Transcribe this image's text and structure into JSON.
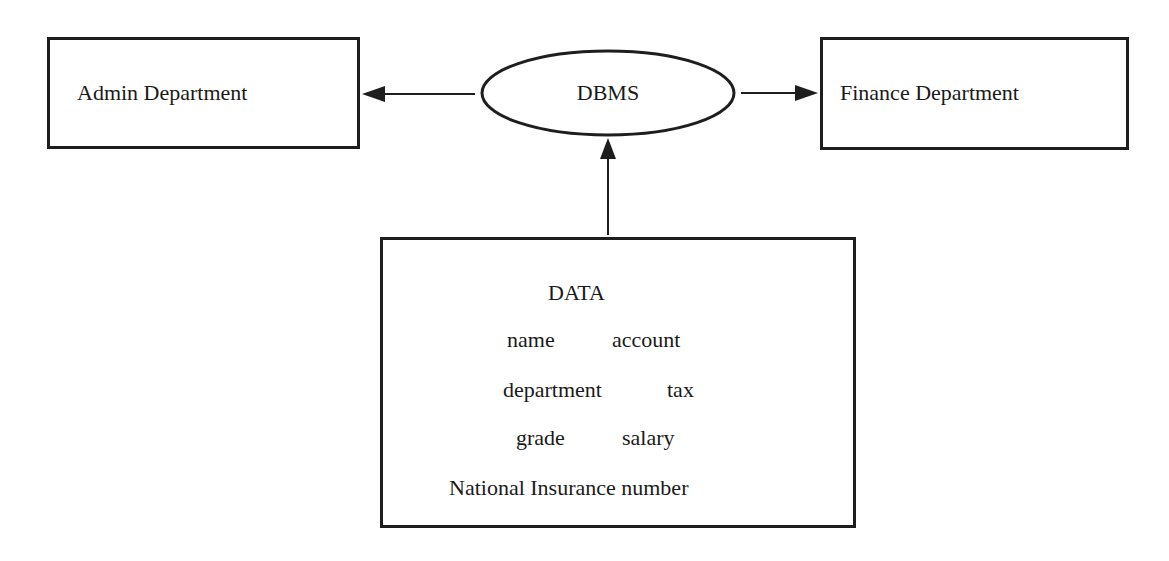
{
  "diagram": {
    "type": "data-flow",
    "nodes": {
      "admin": {
        "label": "Admin Department",
        "shape": "rectangle"
      },
      "dbms": {
        "label": "DBMS",
        "shape": "ellipse"
      },
      "finance": {
        "label": "Finance Department",
        "shape": "rectangle"
      },
      "data": {
        "title": "DATA",
        "shape": "rectangle",
        "fields": {
          "name": "name",
          "account": "account",
          "department": "department",
          "tax": "tax",
          "grade": "grade",
          "salary": "salary",
          "national_insurance": "National Insurance number"
        }
      }
    },
    "edges": [
      {
        "from": "dbms",
        "to": "admin",
        "direction": "left"
      },
      {
        "from": "dbms",
        "to": "finance",
        "direction": "right"
      },
      {
        "from": "data",
        "to": "dbms",
        "direction": "up"
      }
    ],
    "colors": {
      "stroke": "#1e1e1e",
      "text": "#1a1a1a",
      "background": "#ffffff"
    }
  }
}
